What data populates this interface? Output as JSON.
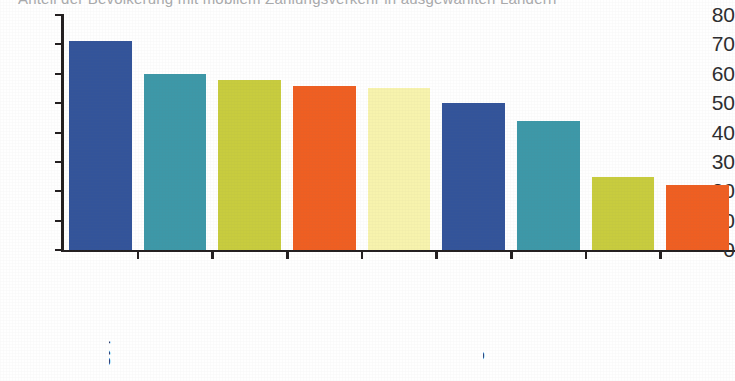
{
  "title": {
    "clipped_text": "Anteil der Bevölkerung mit mobilem Zahlungsverkehr in ausgewählten Ländern"
  },
  "chart_data": {
    "type": "bar",
    "title": "",
    "xlabel": "",
    "ylabel": "",
    "ylim": [
      0,
      80
    ],
    "ytick_step": 10,
    "grid": false,
    "legend": "none",
    "categories": [
      "Ägypten",
      "Indien",
      "Südafrika",
      "Ghana",
      "Kenia",
      "Nigeria",
      "Indonesien",
      "USA",
      "GB"
    ],
    "values": [
      71,
      60,
      58,
      56,
      55,
      50,
      44,
      25,
      22
    ],
    "colors": [
      "#33549a",
      "#3d98a8",
      "#c8cc3e",
      "#ef5f22",
      "#f7f3ad",
      "#33549a",
      "#3d98a8",
      "#c8cc3e",
      "#ef5f22"
    ],
    "y_ticks": [
      "80",
      "70",
      "60",
      "50",
      "40",
      "30",
      "20",
      "10",
      "0"
    ],
    "bars": [
      {
        "label": "Ägypten",
        "value": 71,
        "color": "#33549a"
      },
      {
        "label": "Indien",
        "value": 60,
        "color": "#3d98a8"
      },
      {
        "label": "Südafrika",
        "value": 58,
        "color": "#c8cc3e"
      },
      {
        "label": "Ghana",
        "value": 56,
        "color": "#ef5f22"
      },
      {
        "label": "Kenia",
        "value": 55,
        "color": "#f7f3ad"
      },
      {
        "label": "Nigeria",
        "value": 50,
        "color": "#33549a"
      },
      {
        "label": "Indonesien",
        "value": 44,
        "color": "#3d98a8"
      },
      {
        "label": "USA",
        "value": 25,
        "color": "#c8cc3e"
      },
      {
        "label": "GB",
        "value": 22,
        "color": "#ef5f22"
      }
    ]
  },
  "axis": {
    "axis_color": "#231f20",
    "label_color": "#2d2d2f"
  }
}
